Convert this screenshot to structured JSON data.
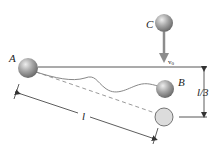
{
  "diagram": {
    "type": "physics-pendulum-collision",
    "labels": {
      "ball_a": "A",
      "ball_b": "B",
      "ball_c": "C",
      "velocity": "v",
      "velocity_sub": "0",
      "length": "l",
      "drop": "l/3"
    },
    "colors": {
      "ball": "#8a8a8a",
      "ball_highlight": "#e4e4e4",
      "ghost_ball": "#dcdcdc",
      "line": "#333333",
      "string": "#777777",
      "dashed": "#9a9a9a",
      "arrow": "#8c8c8c"
    }
  }
}
